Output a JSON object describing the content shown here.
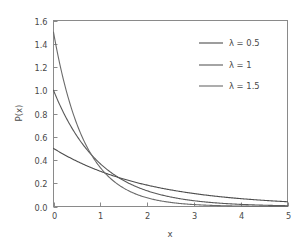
{
  "chart_data": {
    "type": "line",
    "title": "",
    "subtitle": "",
    "xlabel": "x",
    "ylabel": "P(x)",
    "xlim": [
      0,
      5
    ],
    "ylim": [
      0.0,
      1.6
    ],
    "xticks": [
      "0",
      "1",
      "2",
      "3",
      "4",
      "5"
    ],
    "xtick_values": [
      0,
      1,
      2,
      3,
      4,
      5
    ],
    "yticks": [
      "0.0",
      "0.2",
      "0.4",
      "0.6",
      "0.8",
      "1.0",
      "1.2",
      "1.4",
      "1.6"
    ],
    "ytick_values": [
      0.0,
      0.2,
      0.4,
      0.6,
      0.8,
      1.0,
      1.2,
      1.4,
      1.6
    ],
    "grid": false,
    "legend_position": "upper right",
    "series": [
      {
        "name": "λ = 0.5",
        "lambda": 0.5,
        "color": "#4d4d4d",
        "x": [
          0.0,
          0.25,
          0.5,
          0.75,
          1.0,
          1.25,
          1.5,
          1.75,
          2.0,
          2.25,
          2.5,
          2.75,
          3.0,
          3.25,
          3.5,
          3.75,
          4.0,
          4.25,
          4.5,
          4.75,
          5.0
        ],
        "values": [
          0.5,
          0.441,
          0.389,
          0.343,
          0.303,
          0.268,
          0.236,
          0.208,
          0.184,
          0.162,
          0.143,
          0.126,
          0.112,
          0.099,
          0.087,
          0.077,
          0.068,
          0.06,
          0.053,
          0.046,
          0.041
        ]
      },
      {
        "name": "λ = 1",
        "lambda": 1,
        "color": "#5a5a5a",
        "x": [
          0.0,
          0.25,
          0.5,
          0.75,
          1.0,
          1.25,
          1.5,
          1.75,
          2.0,
          2.25,
          2.5,
          2.75,
          3.0,
          3.25,
          3.5,
          3.75,
          4.0,
          4.25,
          4.5,
          4.75,
          5.0
        ],
        "values": [
          1.0,
          0.779,
          0.607,
          0.472,
          0.368,
          0.287,
          0.223,
          0.174,
          0.135,
          0.105,
          0.082,
          0.064,
          0.05,
          0.039,
          0.03,
          0.024,
          0.018,
          0.014,
          0.011,
          0.009,
          0.007
        ]
      },
      {
        "name": "λ = 1.5",
        "lambda": 1.5,
        "color": "#6b6b6b",
        "x": [
          0.0,
          0.25,
          0.5,
          0.75,
          1.0,
          1.25,
          1.5,
          1.75,
          2.0,
          2.25,
          2.5,
          2.75,
          3.0,
          3.25,
          3.5,
          3.75,
          4.0,
          4.25,
          4.5,
          4.75,
          5.0
        ],
        "values": [
          1.5,
          1.031,
          0.709,
          0.487,
          0.335,
          0.23,
          0.158,
          0.109,
          0.075,
          0.051,
          0.035,
          0.024,
          0.017,
          0.011,
          0.008,
          0.005,
          0.004,
          0.003,
          0.002,
          0.001,
          0.001
        ]
      }
    ]
  },
  "style": {
    "background": "#ffffff",
    "axis_color": "#8a8a8a",
    "text_color": "#4a4a4a"
  },
  "legend": {
    "entries": [
      {
        "label": "λ = 0.5"
      },
      {
        "label": "λ = 1"
      },
      {
        "label": "λ = 1.5"
      }
    ]
  }
}
